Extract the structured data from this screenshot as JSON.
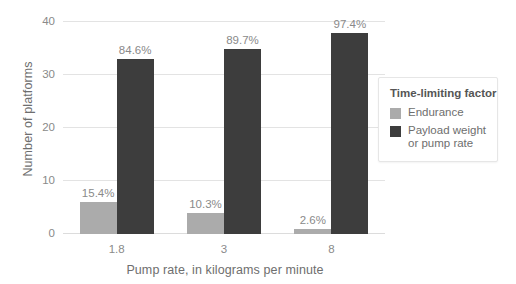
{
  "chart_data": {
    "type": "bar",
    "title": "",
    "xlabel": "Pump rate, in kilograms per minute",
    "ylabel": "Number of platforms",
    "categories": [
      "1.8",
      "3",
      "8"
    ],
    "ylim": [
      0,
      40
    ],
    "yticks": [
      "0",
      "10",
      "20",
      "30",
      "40"
    ],
    "ytick_values": [
      0,
      10,
      20,
      30,
      40
    ],
    "grid": true,
    "legend_position": "right",
    "legend_title": "Time-limiting factor",
    "series": [
      {
        "name": "Endurance",
        "color": "#ababab",
        "values": [
          6,
          4,
          1
        ],
        "labels": [
          "15.4%",
          "10.3%",
          "2.6%"
        ]
      },
      {
        "name": "Payload weight or pump rate",
        "color": "#3d3d3d",
        "values": [
          33,
          35,
          38
        ],
        "labels": [
          "84.6%",
          "89.7%",
          "97.4%"
        ]
      }
    ]
  },
  "legend": {
    "title": "Time-limiting factor",
    "items": [
      {
        "label": "Endurance",
        "color": "#ababab"
      },
      {
        "label": "Payload weight or pump rate",
        "color": "#3d3d3d"
      }
    ]
  },
  "colors": {
    "endurance": "#ababab",
    "payload": "#3d3d3d",
    "grid": "#e3e3e3",
    "text": "#8a8a8a",
    "axis_title": "#6e6e6e",
    "background": "#ffffff"
  }
}
